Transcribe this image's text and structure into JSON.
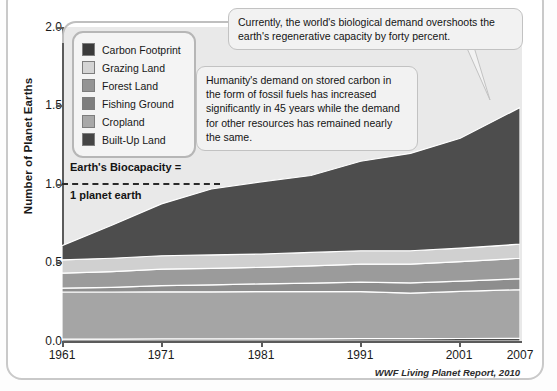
{
  "chart_data": {
    "type": "area",
    "xlabel": "",
    "ylabel": "Number of Planet Earths",
    "xlim": [
      1961,
      2007
    ],
    "ylim": [
      0.0,
      2.0
    ],
    "grid": false,
    "legend_position": "top-left",
    "stacked": true,
    "x": [
      1961,
      1966,
      1971,
      1976,
      1981,
      1986,
      1991,
      1996,
      2001,
      2007
    ],
    "y_ticks": [
      "0.0",
      "0.5",
      "1.0",
      "1.5",
      "2.0"
    ],
    "x_ticks": [
      "1961",
      "1971",
      "1981",
      "1991",
      "2001",
      "2007"
    ],
    "series": [
      {
        "name": "Built-Up Land",
        "color": "#4a4a4a",
        "values": [
          0.012,
          0.012,
          0.013,
          0.013,
          0.014,
          0.014,
          0.015,
          0.015,
          0.016,
          0.017
        ]
      },
      {
        "name": "Cropland",
        "color": "#a5a5a5",
        "values": [
          0.3,
          0.3,
          0.3,
          0.3,
          0.3,
          0.3,
          0.3,
          0.29,
          0.3,
          0.31
        ]
      },
      {
        "name": "Fishing Ground",
        "color": "#8e8e8e",
        "values": [
          0.025,
          0.03,
          0.04,
          0.045,
          0.05,
          0.055,
          0.06,
          0.065,
          0.065,
          0.07
        ]
      },
      {
        "name": "Forest Land",
        "color": "#9b9b9b",
        "values": [
          0.095,
          0.1,
          0.105,
          0.105,
          0.105,
          0.11,
          0.115,
          0.12,
          0.125,
          0.13
        ]
      },
      {
        "name": "Grazing Land",
        "color": "#d0d0d0",
        "values": [
          0.085,
          0.085,
          0.085,
          0.085,
          0.085,
          0.085,
          0.085,
          0.085,
          0.085,
          0.09
        ]
      },
      {
        "name": "Carbon Footprint",
        "color": "#4d4d4d",
        "values": [
          0.09,
          0.21,
          0.33,
          0.42,
          0.46,
          0.49,
          0.57,
          0.62,
          0.7,
          0.87
        ]
      }
    ],
    "totals": [
      0.61,
      0.74,
      0.87,
      0.97,
      1.02,
      1.05,
      1.15,
      1.2,
      1.29,
      1.49
    ],
    "reference_line": {
      "value": 1.0,
      "label_top": "Earth's Biocapacity =",
      "label_bottom": "1 planet earth",
      "style": "dashed"
    },
    "source": "WWF Living Planet Report, 2010"
  },
  "axes": {
    "y_label": "Number of Planet Earths",
    "y_ticks": [
      "2.0",
      "1.5",
      "1.0",
      "0.5",
      "0.0"
    ],
    "x_ticks": [
      "1961",
      "1971",
      "1981",
      "1991",
      "2001",
      "2007"
    ]
  },
  "legend": {
    "items": [
      {
        "label": "Carbon Footprint",
        "color": "#3b3b3b"
      },
      {
        "label": "Grazing Land",
        "color": "#d4d4d4"
      },
      {
        "label": "Forest Land",
        "color": "#949494"
      },
      {
        "label": "Fishing Ground",
        "color": "#7e7e7e"
      },
      {
        "label": "Cropland",
        "color": "#a8a8a8"
      },
      {
        "label": "Built-Up Land",
        "color": "#454545"
      }
    ]
  },
  "annotations": {
    "biocapacity_top": "Earth's Biocapacity =",
    "biocapacity_bottom": "1 planet earth",
    "callout_1": "Currently, the world's biological demand overshoots the earth's regenerative capacity by forty percent.",
    "callout_2": "Humanity's demand on stored carbon in the form of fossil fuels has increased significantly in 45 years while the demand for other resources has remained nearly the same."
  },
  "credit": "WWF Living Planet Report, 2010"
}
